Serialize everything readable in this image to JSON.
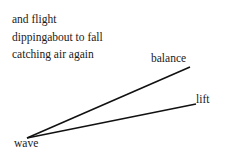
{
  "poem": {
    "lines": [
      "and flight",
      "dippingabout to fall",
      "catching air again"
    ]
  },
  "diagram": {
    "labels": {
      "balance": "balance",
      "lift": "lift",
      "wave": "wave"
    },
    "origin": {
      "x": 27,
      "y": 138
    },
    "rays": [
      {
        "name": "balance",
        "x2": 190,
        "y2": 67
      },
      {
        "name": "lift",
        "x2": 196,
        "y2": 104
      }
    ],
    "line_color": "#111111"
  }
}
